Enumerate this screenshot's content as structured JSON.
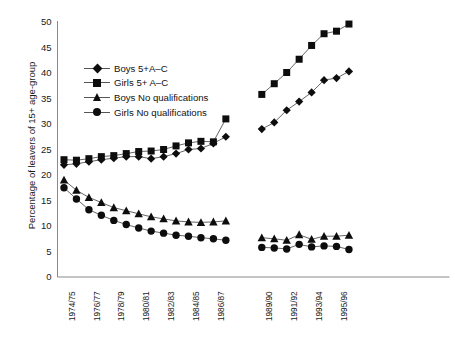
{
  "chart_data": {
    "type": "line",
    "title": "",
    "subtitle": "",
    "xlabel": "",
    "ylabel": "Percentage of leavers of 15+ age-group",
    "ylim": [
      0,
      50
    ],
    "ytick_step": 5,
    "yticks": [
      0,
      5,
      10,
      15,
      20,
      25,
      30,
      35,
      40,
      45,
      50
    ],
    "grid": false,
    "legend_position": "upper-left-inside",
    "axis_style": "left-and-bottom-spine-only",
    "note": "Series are split into two blocks with a discontinuity (break) between 1987/88 and 1988/89; annual points, only alternate years labelled.",
    "x_all": [
      "1974/75",
      "1975/76",
      "1976/77",
      "1977/78",
      "1978/79",
      "1979/80",
      "1980/81",
      "1981/82",
      "1982/83",
      "1983/84",
      "1984/85",
      "1985/86",
      "1986/87",
      "1987/88",
      "1988/89",
      "1989/90",
      "1990/91",
      "1991/92",
      "1992/93",
      "1993/94",
      "1994/95",
      "1995/96",
      "1996/97"
    ],
    "xtick_labels": [
      "1974/75",
      "1976/77",
      "1978/79",
      "1980/81",
      "1982/83",
      "1984/85",
      "1986/87",
      "1989/90",
      "1991/92",
      "1993/94",
      "1995/96"
    ],
    "xtick_indices": [
      0,
      2,
      4,
      6,
      8,
      10,
      12,
      15,
      17,
      19,
      21
    ],
    "break_after_index": 13,
    "series": [
      {
        "name": "Boys 5+A–C",
        "marker": "diamond",
        "color": "#0d0d0d",
        "values": [
          22.0,
          22.2,
          22.6,
          23.0,
          23.3,
          23.6,
          23.6,
          23.2,
          23.6,
          24.2,
          25.0,
          25.2,
          26.2,
          27.5,
          null,
          29.0,
          30.3,
          32.7,
          34.4,
          36.2,
          38.6,
          39.0,
          40.3
        ]
      },
      {
        "name": "Girls 5+ A–C",
        "marker": "square",
        "color": "#0d0d0d",
        "values": [
          23.0,
          22.9,
          23.2,
          23.6,
          23.8,
          24.2,
          24.6,
          24.7,
          25.0,
          25.7,
          26.3,
          26.6,
          26.5,
          31.0,
          null,
          35.8,
          37.9,
          40.1,
          42.7,
          45.4,
          47.7,
          48.2,
          49.6
        ]
      },
      {
        "name": "Boys No qualifications",
        "marker": "triangle",
        "color": "#0d0d0d",
        "values": [
          19.0,
          17.0,
          15.6,
          14.6,
          13.6,
          13.0,
          12.4,
          11.8,
          11.4,
          11.0,
          10.8,
          10.7,
          10.8,
          11.0,
          null,
          7.7,
          7.5,
          7.2,
          8.3,
          7.4,
          8.0,
          8.0,
          8.2
        ]
      },
      {
        "name": "Girls No qualifications",
        "marker": "circle",
        "color": "#0d0d0d",
        "values": [
          17.5,
          15.3,
          13.2,
          12.1,
          11.1,
          10.3,
          9.6,
          9.0,
          8.6,
          8.2,
          8.0,
          7.7,
          7.5,
          7.2,
          null,
          5.8,
          5.7,
          5.5,
          6.4,
          5.9,
          6.1,
          6.0,
          5.4
        ]
      }
    ]
  }
}
